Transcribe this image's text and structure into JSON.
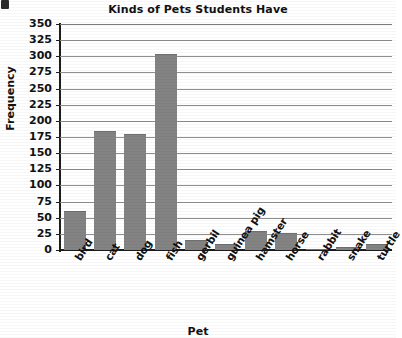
{
  "chart_data": {
    "type": "bar",
    "title": "Kinds of Pets Students Have",
    "xlabel": "Pet",
    "ylabel": "Frequency",
    "categories": [
      "bird",
      "cat",
      "dog",
      "fish",
      "gerbil",
      "guinea pig",
      "hamster",
      "horse",
      "rabbit",
      "snake",
      "turtle"
    ],
    "values": [
      60,
      184,
      179,
      303,
      15,
      10,
      30,
      26,
      1,
      5,
      9
    ],
    "ylim": [
      0,
      350
    ],
    "yticks": [
      0,
      25,
      50,
      75,
      100,
      125,
      150,
      175,
      200,
      225,
      250,
      275,
      300,
      325,
      350
    ],
    "ytick_labels": [
      "0",
      "25",
      "50",
      "75",
      "100",
      "125",
      "150",
      "175",
      "200",
      "225",
      "250",
      "275",
      "300",
      "325",
      "350"
    ],
    "grid": true,
    "legend": false,
    "bar_color": "#838383",
    "axis_color": "#1c1c1c",
    "gridline_color": "#8e8e8e"
  }
}
